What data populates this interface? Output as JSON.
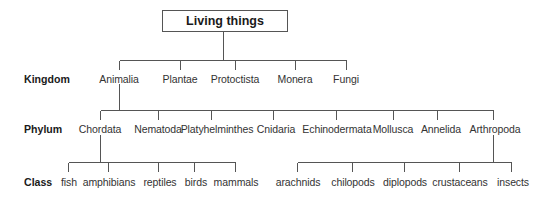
{
  "title": "Living things",
  "rows": {
    "kingdom": "Kingdom",
    "phylum": "Phylum",
    "class": "Class"
  },
  "kingdoms": [
    "Animalia",
    "Plantae",
    "Protoctista",
    "Monera",
    "Fungi"
  ],
  "phyla": [
    "Chordata",
    "Nematoda",
    "Platyhelminthes",
    "Cnidaria",
    "Echinodermata",
    "Mollusca",
    "Annelida",
    "Arthropoda"
  ],
  "chordata_classes": [
    "fish",
    "amphibians",
    "reptiles",
    "birds",
    "mammals"
  ],
  "arthropoda_classes": [
    "arachnids",
    "chilopods",
    "diplopods",
    "crustaceans",
    "insects"
  ],
  "colors": {
    "line": "#555555",
    "text": "#333333"
  }
}
